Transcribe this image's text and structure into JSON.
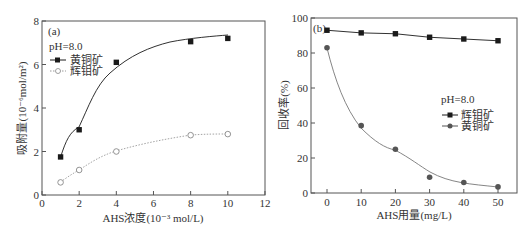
{
  "chart_data": [
    {
      "panel": "(a)",
      "type": "line",
      "title": "",
      "xlabel": "AHS浓度(10⁻³ mol/L)",
      "ylabel": "吸附量(10⁻⁶mol/m²)",
      "xlim": [
        0,
        12
      ],
      "ylim": [
        0,
        8
      ],
      "xticks": [
        0,
        2,
        4,
        6,
        8,
        10,
        12
      ],
      "yticks": [
        0,
        2,
        4,
        6,
        8
      ],
      "grid": false,
      "legend_position": "upper left",
      "annotation": "pH=8.0",
      "x": [
        1,
        2,
        4,
        8,
        10
      ],
      "series": [
        {
          "name": "黄铜矿",
          "marker": "filled-square",
          "line": "solid",
          "color": "#1a1a1a",
          "values": [
            1.75,
            3.0,
            6.1,
            7.05,
            7.2
          ]
        },
        {
          "name": "辉钼矿",
          "marker": "open-circle",
          "line": "dotted",
          "color": "#888888",
          "values": [
            0.58,
            1.15,
            2.0,
            2.75,
            2.8
          ]
        }
      ]
    },
    {
      "panel": "(b)",
      "type": "line",
      "title": "",
      "xlabel": "AHS用量(mg/L)",
      "ylabel": "回收率(%)",
      "xlim": [
        -5,
        55
      ],
      "ylim": [
        0,
        100
      ],
      "xticks": [
        0,
        10,
        20,
        30,
        40,
        50
      ],
      "yticks": [
        0,
        20,
        40,
        60,
        80,
        100
      ],
      "grid": false,
      "legend_position": "center right",
      "annotation": "pH=8.0",
      "x": [
        0,
        10,
        20,
        30,
        40,
        50
      ],
      "series": [
        {
          "name": "辉钼矿",
          "marker": "filled-square",
          "line": "solid",
          "color": "#1a1a1a",
          "values": [
            93,
            91.5,
            91,
            89,
            88,
            87
          ]
        },
        {
          "name": "黄铜矿",
          "marker": "filled-circle",
          "line": "solid",
          "color": "#555555",
          "values": [
            83,
            38.5,
            25,
            9,
            6,
            3.5
          ]
        }
      ]
    }
  ],
  "panels": {
    "a": {
      "label": "(a)",
      "ph": "pH=8.0",
      "legend": [
        "黄铜矿",
        "辉钼矿"
      ],
      "xlabel": "AHS浓度(10⁻³ mol/L)",
      "ylabel": "吸附量(10⁻⁶mol/m²)",
      "xticks": [
        "0",
        "2",
        "4",
        "6",
        "8",
        "10",
        "12"
      ],
      "yticks": [
        "0",
        "2",
        "4",
        "6",
        "8"
      ]
    },
    "b": {
      "label": "(b)",
      "ph": "pH=8.0",
      "legend": [
        "辉钼矿",
        "黄铜矿"
      ],
      "xlabel": "AHS用量(mg/L)",
      "ylabel": "回收率(%)",
      "xticks": [
        "0",
        "10",
        "20",
        "30",
        "40",
        "50"
      ],
      "yticks": [
        "0",
        "20",
        "40",
        "60",
        "80",
        "100"
      ]
    }
  }
}
